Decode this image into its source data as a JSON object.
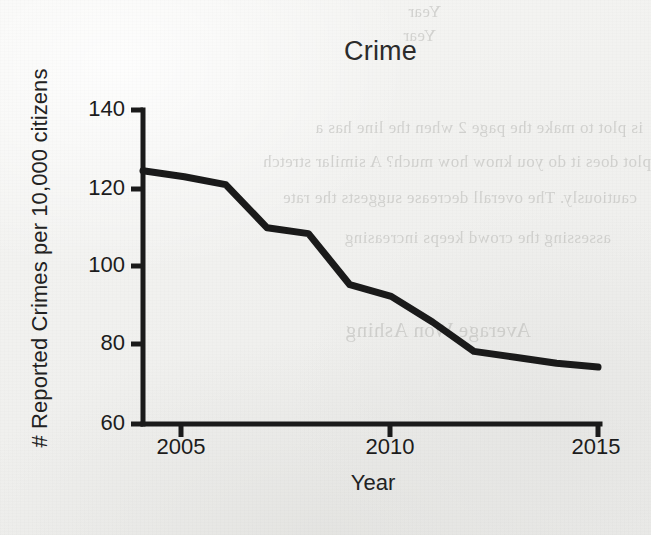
{
  "chart_data": {
    "type": "line",
    "title": "Crime",
    "xlabel": "Year",
    "ylabel": "# Reported Crimes per 10,000 citizens",
    "x": [
      2004,
      2005,
      2006,
      2007,
      2008,
      2009,
      2010,
      2011,
      2012,
      2013,
      2014,
      2015
    ],
    "values": [
      124.5,
      123.0,
      121.0,
      110.0,
      108.5,
      95.5,
      92.5,
      86.0,
      78.5,
      77.0,
      75.5,
      74.5
    ],
    "series": [
      {
        "name": "Reported crimes per 10,000 citizens",
        "values": [
          124.5,
          123.0,
          121.0,
          110.0,
          108.5,
          95.5,
          92.5,
          86.0,
          78.5,
          77.0,
          75.5,
          74.5
        ]
      }
    ],
    "xlim": [
      2004,
      2015
    ],
    "ylim": [
      60,
      140
    ],
    "xticks": [
      2005,
      2010,
      2015
    ],
    "xtick_labels": [
      "2005",
      "2010",
      "2015"
    ],
    "yticks": [
      60,
      80,
      100,
      120,
      140
    ],
    "ytick_labels": [
      "60",
      "80",
      "100",
      "120",
      "140"
    ],
    "grid": false,
    "legend": "none",
    "line_color": "#1a1a1a",
    "markers": false,
    "annotations": []
  },
  "axis": {
    "y_ticks": [
      {
        "label": "140",
        "value": 140
      },
      {
        "label": "120",
        "value": 120
      },
      {
        "label": "100",
        "value": 100
      },
      {
        "label": "80",
        "value": 80
      },
      {
        "label": "60",
        "value": 60
      }
    ],
    "x_ticks": [
      {
        "label": "2005",
        "value": 2005
      },
      {
        "label": "2010",
        "value": 2010
      },
      {
        "label": "2015",
        "value": 2015
      }
    ]
  },
  "background_bleedthrough": {
    "note": "faint mirrored text showing through the paper from the reverse side",
    "lines": [
      "Year",
      "Year",
      "is plot to make the page 2  when the line has a",
      "plot does it do you know how much? A similar stretch",
      "cautiously. The overall decrease suggests the rate",
      "assessing the crowd keeps increasing",
      "Average Won Ashing"
    ]
  }
}
